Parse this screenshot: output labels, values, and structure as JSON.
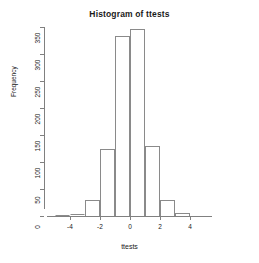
{
  "chart_data": {
    "type": "bar",
    "title": "Histogram of ttests",
    "xlabel": "ttests",
    "ylabel": "Frequency",
    "grid": false,
    "legend": null,
    "binwidth": 1,
    "xlim": [
      -5,
      4
    ],
    "ylim": [
      0,
      350
    ],
    "xticks": [
      -4,
      -2,
      0,
      2,
      4
    ],
    "xtick_labels": [
      "-4",
      "-2",
      "0",
      "2",
      "4"
    ],
    "yticks": [
      0,
      50,
      100,
      150,
      200,
      250,
      300,
      350
    ],
    "ytick_labels": [
      "0",
      "50",
      "100",
      "150",
      "200",
      "250",
      "300",
      "350"
    ],
    "bins": [
      {
        "left": -5,
        "right": -4,
        "center": -4.5,
        "value": 1
      },
      {
        "left": -4,
        "right": -3,
        "center": -3.5,
        "value": 3
      },
      {
        "left": -3,
        "right": -2,
        "center": -2.5,
        "value": 30
      },
      {
        "left": -2,
        "right": -1,
        "center": -1.5,
        "value": 125
      },
      {
        "left": -1,
        "right": 0,
        "center": -0.5,
        "value": 333
      },
      {
        "left": 0,
        "right": 1,
        "center": 0.5,
        "value": 347
      },
      {
        "left": 1,
        "right": 2,
        "center": 1.5,
        "value": 130
      },
      {
        "left": 2,
        "right": 3,
        "center": 2.5,
        "value": 30
      },
      {
        "left": 3,
        "right": 4,
        "center": 3.5,
        "value": 6
      }
    ],
    "categories": [
      "-4.5",
      "-3.5",
      "-2.5",
      "-1.5",
      "-0.5",
      "0.5",
      "1.5",
      "2.5",
      "3.5"
    ],
    "values": [
      1,
      3,
      30,
      125,
      333,
      347,
      130,
      30,
      6
    ],
    "colors": {
      "bar_border": "#8a8a8a",
      "bar_fill": "transparent",
      "axis": "#808080",
      "text": "#1a1a1a",
      "background": "#ffffff"
    }
  }
}
